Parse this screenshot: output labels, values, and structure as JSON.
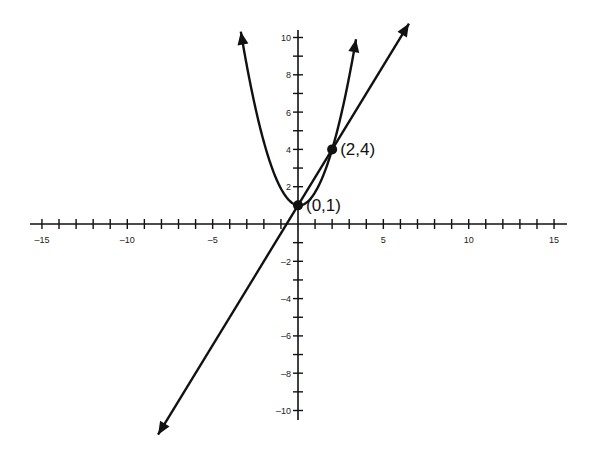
{
  "chart_data": {
    "type": "line",
    "title": "",
    "xlabel": "",
    "ylabel": "",
    "xlim": [
      -15,
      15
    ],
    "ylim": [
      -10,
      10
    ],
    "grid": false,
    "legend": null,
    "x_ticks": [
      -15,
      -14,
      -13,
      -12,
      -11,
      -10,
      -9,
      -8,
      -7,
      -6,
      -5,
      -4,
      -3,
      -2,
      -1,
      1,
      2,
      3,
      4,
      5,
      6,
      7,
      8,
      9,
      10,
      11,
      12,
      13,
      14,
      15
    ],
    "x_tick_labels": [
      {
        "value": -15,
        "label": "-15"
      },
      {
        "value": -10,
        "label": "-10"
      },
      {
        "value": -5,
        "label": "-5"
      },
      {
        "value": 5,
        "label": "5"
      },
      {
        "value": 10,
        "label": "10"
      },
      {
        "value": 15,
        "label": "15"
      }
    ],
    "y_ticks": [
      -10,
      -9,
      -8,
      -7,
      -6,
      -5,
      -4,
      -3,
      -2,
      -1,
      1,
      2,
      3,
      4,
      5,
      6,
      7,
      8,
      9,
      10
    ],
    "y_tick_labels": [
      {
        "value": 10,
        "label": "10"
      },
      {
        "value": 8,
        "label": "8"
      },
      {
        "value": 6,
        "label": "6"
      },
      {
        "value": 4,
        "label": "4"
      },
      {
        "value": 2,
        "label": "2"
      },
      {
        "value": -2,
        "label": "-2"
      },
      {
        "value": -4,
        "label": "-4"
      },
      {
        "value": -6,
        "label": "-6"
      },
      {
        "value": -8,
        "label": "-8"
      },
      {
        "value": -10,
        "label": "-10"
      }
    ],
    "series": [
      {
        "name": "parabola",
        "kind": "curve",
        "description": "Upward-opening parabola through (0,1) and (2,4) with arrowheads at both ends",
        "x_range": [
          -3.35,
          3.4
        ],
        "approx_equation": "y = 0.8x^2 - 0.1x + 1",
        "arrows": "both"
      },
      {
        "name": "line",
        "kind": "line",
        "description": "Straight line through (0,1) and (2,4) with arrowheads at both ends",
        "x_range": [
          -8.2,
          6.5
        ],
        "approx_equation": "y = 1.5x + 1",
        "arrows": "both"
      }
    ],
    "points": [
      {
        "x": 0,
        "y": 1,
        "label": "(0,1)"
      },
      {
        "x": 2,
        "y": 4,
        "label": "(2,4)"
      }
    ],
    "annotations": [
      "(0,1)",
      "(2,4)"
    ]
  },
  "colors": {
    "ink": "#111111",
    "background": "#ffffff"
  }
}
